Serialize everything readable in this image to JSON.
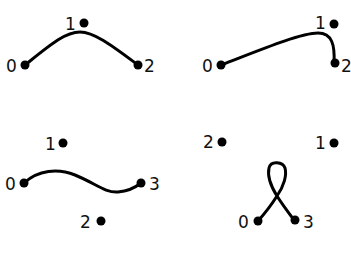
{
  "panels": [
    {
      "id": "panel-top-left",
      "points": [
        {
          "label": "0"
        },
        {
          "label": "1"
        },
        {
          "label": "2"
        }
      ],
      "curve_connects": [
        "0",
        "2"
      ],
      "description": "Arc from 0 to 2 passing below point 1"
    },
    {
      "id": "panel-top-right",
      "points": [
        {
          "label": "0"
        },
        {
          "label": "1"
        },
        {
          "label": "2"
        }
      ],
      "curve_connects": [
        "0",
        "2"
      ],
      "description": "Curve from 0 sweeping up to near 1, then bending down to 2"
    },
    {
      "id": "panel-bottom-left",
      "points": [
        {
          "label": "0"
        },
        {
          "label": "1"
        },
        {
          "label": "2"
        },
        {
          "label": "3"
        }
      ],
      "curve_connects": [
        "0",
        "3"
      ],
      "description": "S-shaped curve from 0 to 3 passing between points 1 and 2"
    },
    {
      "id": "panel-bottom-right",
      "points": [
        {
          "label": "0"
        },
        {
          "label": "1"
        },
        {
          "label": "2"
        },
        {
          "label": "3"
        }
      ],
      "curve_connects": [
        "0",
        "3"
      ],
      "description": "Curve from 0 to 3 forming a self-intersecting loop upward"
    }
  ],
  "colors": {
    "stroke": "#000000",
    "background": "#ffffff"
  }
}
